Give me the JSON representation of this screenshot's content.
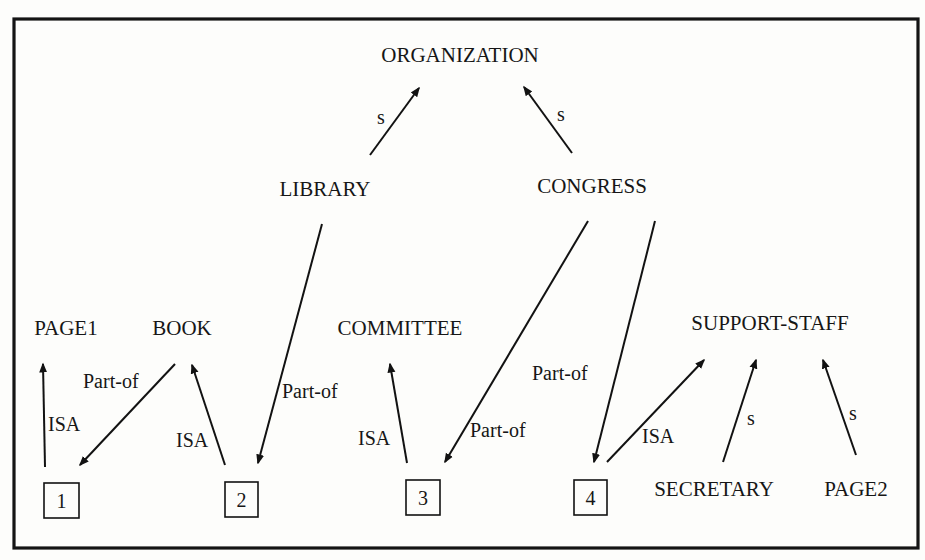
{
  "diagram": {
    "type": "semantic-network",
    "nodes": {
      "organization": {
        "label": "ORGANIZATION",
        "x": 460,
        "y": 62
      },
      "library": {
        "label": "LIBRARY",
        "x": 325,
        "y": 196
      },
      "congress": {
        "label": "CONGRESS",
        "x": 592,
        "y": 193
      },
      "page1": {
        "label": "PAGE1",
        "x": 66,
        "y": 335
      },
      "book": {
        "label": "BOOK",
        "x": 182,
        "y": 335
      },
      "committee": {
        "label": "COMMITTEE",
        "x": 400,
        "y": 335
      },
      "support_staff": {
        "label": "SUPPORT-STAFF",
        "x": 770,
        "y": 330
      },
      "secretary": {
        "label": "SECRETARY",
        "x": 714,
        "y": 496
      },
      "page2": {
        "label": "PAGE2",
        "x": 856,
        "y": 496
      }
    },
    "instance_boxes": [
      {
        "id": "box1",
        "label": "1",
        "x": 44,
        "y": 483,
        "w": 35,
        "h": 35
      },
      {
        "id": "box2",
        "label": "2",
        "x": 225,
        "y": 482,
        "w": 33,
        "h": 35
      },
      {
        "id": "box3",
        "label": "3",
        "x": 406,
        "y": 480,
        "w": 34,
        "h": 35
      },
      {
        "id": "box4",
        "label": "4",
        "x": 574,
        "y": 480,
        "w": 33,
        "h": 35
      }
    ],
    "edges": [
      {
        "id": "library-organization",
        "from": "LIBRARY",
        "to": "ORGANIZATION",
        "label": "s",
        "x1": 370,
        "y1": 155,
        "x2": 419,
        "y2": 88,
        "lx": 377,
        "ly": 124
      },
      {
        "id": "congress-organization",
        "from": "CONGRESS",
        "to": "ORGANIZATION",
        "label": "s",
        "x1": 572,
        "y1": 153,
        "x2": 524,
        "y2": 87,
        "lx": 557,
        "ly": 121
      },
      {
        "id": "box1-page1",
        "from": "1",
        "to": "PAGE1",
        "label": "ISA",
        "x1": 45,
        "y1": 467,
        "x2": 43,
        "y2": 364,
        "lx": 48,
        "ly": 431
      },
      {
        "id": "book-box1",
        "from": "BOOK",
        "to": "1",
        "label": "Part-of",
        "x1": 175,
        "y1": 364,
        "x2": 80,
        "y2": 465,
        "lx": 83,
        "ly": 388
      },
      {
        "id": "box2-book",
        "from": "2",
        "to": "BOOK",
        "label": "ISA",
        "x1": 225,
        "y1": 465,
        "x2": 192,
        "y2": 365,
        "lx": 176,
        "ly": 447
      },
      {
        "id": "library-box2",
        "from": "LIBRARY",
        "to": "2",
        "label": "Part-of",
        "x1": 322,
        "y1": 224,
        "x2": 258,
        "y2": 463,
        "lx": 282,
        "ly": 398
      },
      {
        "id": "box3-committee",
        "from": "3",
        "to": "COMMITTEE",
        "label": "ISA",
        "x1": 407,
        "y1": 463,
        "x2": 390,
        "y2": 364,
        "lx": 358,
        "ly": 445
      },
      {
        "id": "congress-box3",
        "from": "CONGRESS",
        "to": "3",
        "label": "Part-of",
        "x1": 588,
        "y1": 221,
        "x2": 445,
        "y2": 462,
        "lx": 470,
        "ly": 437
      },
      {
        "id": "congress-box4",
        "from": "CONGRESS",
        "to": "4",
        "label": "Part-of",
        "x1": 655,
        "y1": 221,
        "x2": 594,
        "y2": 462,
        "lx": 532,
        "ly": 380
      },
      {
        "id": "box4-support-staff",
        "from": "4",
        "to": "SUPPORT-STAFF",
        "label": "ISA",
        "x1": 607,
        "y1": 462,
        "x2": 704,
        "y2": 360,
        "lx": 642,
        "ly": 443
      },
      {
        "id": "secretary-support-staff",
        "from": "SECRETARY",
        "to": "SUPPORT-STAFF",
        "label": "s",
        "x1": 723,
        "y1": 462,
        "x2": 756,
        "y2": 360,
        "lx": 747,
        "ly": 425
      },
      {
        "id": "page2-support-staff",
        "from": "PAGE2",
        "to": "SUPPORT-STAFF",
        "label": "s",
        "x1": 856,
        "y1": 455,
        "x2": 823,
        "y2": 360,
        "lx": 849,
        "ly": 420
      }
    ],
    "frame": {
      "x": 14,
      "y": 19,
      "w": 904,
      "h": 529
    }
  }
}
